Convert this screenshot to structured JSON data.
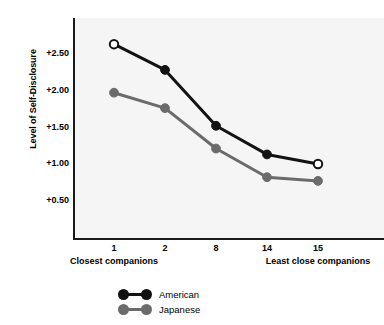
{
  "chart_data": {
    "type": "line",
    "title": "",
    "subtitle": "",
    "xlabel": "",
    "ylabel": "Level of Self-Disclosure",
    "categories": [
      "1",
      "2",
      "8",
      "14",
      "15"
    ],
    "x_axis_notes": {
      "left_caption": "Closest companions",
      "right_caption": "Least close companions"
    },
    "xtick_labels": [
      "1",
      "2",
      "8",
      "14",
      "15"
    ],
    "ytick_labels": [
      "+2.50",
      "+2.00",
      "+1.50",
      "+1.00",
      "+0.50"
    ],
    "ytick_values": [
      2.5,
      2.0,
      1.5,
      1.0,
      0.5
    ],
    "ylim": [
      0.12,
      2.88
    ],
    "grid": false,
    "legend_position": "bottom-center",
    "series": [
      {
        "name": "American",
        "color": "#121212",
        "marker": "circle",
        "marker_fill_first_last": "open",
        "values": [
          2.62,
          2.27,
          1.51,
          1.12,
          0.99
        ]
      },
      {
        "name": "Japanese",
        "color": "#6b6b6b",
        "marker": "circle",
        "marker_fill_first_last": "filled",
        "values": [
          1.96,
          1.75,
          1.2,
          0.81,
          0.76
        ]
      }
    ]
  },
  "legend": {
    "items": [
      {
        "label": "American",
        "color": "#121212"
      },
      {
        "label": "Japanese",
        "color": "#6b6b6b"
      }
    ]
  },
  "colors": {
    "american": "#121212",
    "japanese": "#6b6b6b",
    "plot_background": "#f5f5f5",
    "axis": "#1a1a1a",
    "page_background": "#ffffff"
  }
}
